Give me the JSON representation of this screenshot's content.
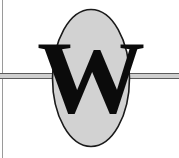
{
  "logo": {
    "monogram": "W",
    "shape": "ellipse",
    "colors": {
      "background": "#ffffff",
      "ellipse_fill": "#d2d2d2",
      "ellipse_stroke": "#1a1a1a",
      "letter": "#0b0b0b",
      "rule": "#5c5c5c",
      "rule_inner": "#cfcfcf",
      "left_rule": "#9a9a9a"
    },
    "geometry": {
      "canvas_width": 179,
      "canvas_height": 158,
      "ellipse_cx": 90,
      "ellipse_cy": 78,
      "ellipse_rx": 39,
      "ellipse_ry": 69,
      "rule_y": 76,
      "left_rule_x": 2
    }
  }
}
